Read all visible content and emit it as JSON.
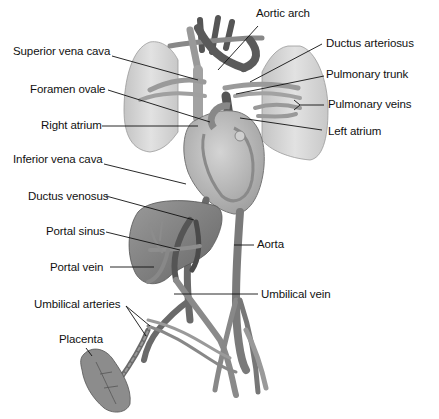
{
  "colors": {
    "background": "#ffffff",
    "vessel_dark": "#5a5a5a",
    "vessel_mid": "#8a8a8a",
    "vessel_light": "#a8a8a8",
    "lung": "#d6d6d6",
    "lung_edge": "#9a9a9a",
    "heart": "#b8b8b8",
    "liver": "#7d7d7d",
    "placenta": "#8c8c8c",
    "leader_line": "#111111",
    "label_text": "#111111"
  },
  "labels": {
    "aortic_arch": "Aortic arch",
    "superior_vena_cava": "Superior vena cava",
    "ductus_arteriosus": "Ductus arteriosus",
    "pulmonary_trunk": "Pulmonary trunk",
    "foramen_ovale": "Foramen ovale",
    "pulmonary_veins": "Pulmonary veins",
    "right_atrium": "Right atrium",
    "left_atrium": "Left atrium",
    "inferior_vena_cava": "Inferior vena cava",
    "ductus_venosus": "Ductus venosus",
    "portal_sinus": "Portal sinus",
    "aorta": "Aorta",
    "portal_vein": "Portal vein",
    "umbilical_vein": "Umbilical vein",
    "umbilical_arteries": "Umbilical arteries",
    "placenta": "Placenta"
  },
  "structures": [
    "lungs",
    "heart",
    "aortic arch",
    "superior vena cava",
    "inferior vena cava",
    "liver",
    "descending aorta",
    "umbilical cord",
    "placenta",
    "iliac vessels"
  ]
}
